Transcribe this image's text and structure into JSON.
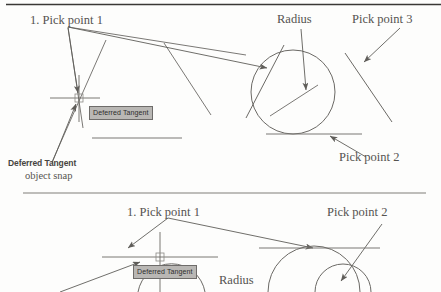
{
  "page": {
    "width": 441,
    "height": 292,
    "background": "#fdfdfc",
    "ink_color": "#6b6965",
    "ink_dark": "#4a4845",
    "rule_color_top": "#3a3835",
    "rule_color_mid": "#a9a7a4"
  },
  "rules": [
    {
      "name": "top-rule",
      "x1": 6,
      "y1": 4,
      "x2": 441,
      "y2": 4,
      "width": 1.6,
      "color": "#3a3835"
    },
    {
      "name": "mid-rule",
      "x1": 23,
      "y1": 193,
      "x2": 426,
      "y2": 193,
      "width": 1.4,
      "color": "#a9a7a4"
    }
  ],
  "figure_top": {
    "name": "tangent-tangent-radius-figure",
    "labels": {
      "pick_point_1": "1. Pick point 1",
      "radius": "Radius",
      "pick_point_3": "Pick point 3",
      "pick_point_2": "Pick point 2"
    },
    "tooltip": "Deferred Tangent",
    "snap_name": "Deferred Tangent",
    "snap_sub": "object snap",
    "circle": {
      "cx": 293,
      "cy": 92,
      "r": 42
    },
    "crosshair": {
      "cx": 72,
      "cy": 98,
      "half_h": 23,
      "half_w": 25
    }
  },
  "figure_bottom": {
    "name": "tangent-tangent-radius-figure-step2",
    "labels": {
      "pick_point_1": "1. Pick point 1",
      "pick_point_2": "Pick point 2",
      "radius": "Radius"
    },
    "tooltip": "Deferred Tangent",
    "crosshair": {
      "cx": 160,
      "cy": 257,
      "half_h": 23,
      "half_w": 58
    }
  },
  "colors": {
    "tooltip_bg": "#b9b7b4",
    "tooltip_border": "#6e6c6a",
    "tooltip_text": "#2e2d2c",
    "label_text": "#555350",
    "snap_bold_text": "#46443f"
  }
}
